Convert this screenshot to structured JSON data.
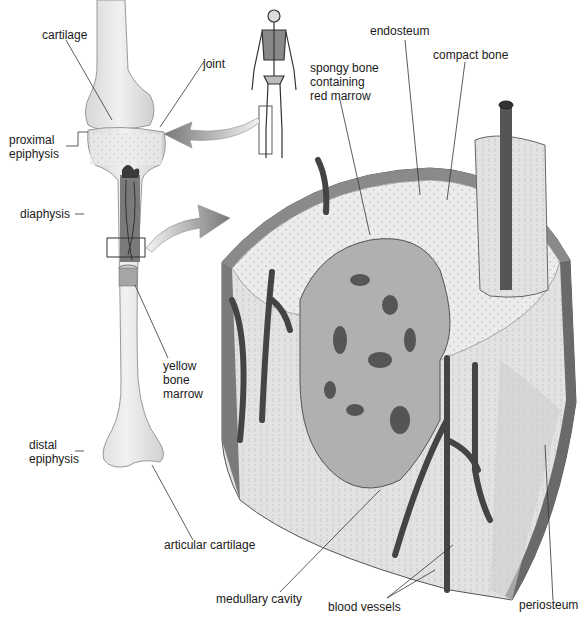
{
  "diagram": {
    "colors": {
      "background": "#ffffff",
      "bone_light": "#e9e9e9",
      "bone_mid": "#bdbdbd",
      "bone_dark": "#6a6a6a",
      "vessel": "#4a4a4a",
      "leader_line": "#333333",
      "text": "#1a1a1a"
    },
    "labels": {
      "cartilage": "cartilage",
      "joint": "joint",
      "proximal_epiphysis": "proximal\nepiphysis",
      "diaphysis": "diaphysis",
      "yellow_bone_marrow": "yellow\nbone\nmarrow",
      "distal_epiphysis": "distal\nepiphysis",
      "articular_cartilage": "articular cartilage",
      "endosteum": "endosteum",
      "compact_bone": "compact bone",
      "spongy_bone": "spongy bone\ncontaining\nred marrow",
      "medullary_cavity": "medullary cavity",
      "blood_vessels": "blood vessels",
      "periosteum": "periosteum"
    }
  }
}
